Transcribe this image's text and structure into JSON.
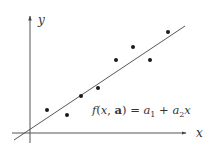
{
  "diagram": {
    "type": "linear-regression-illustration",
    "axes": {
      "x_label": "x",
      "y_label": "y",
      "origin_px": [
        30,
        133
      ],
      "x_axis_px": {
        "x1": 12,
        "x2": 186,
        "y": 133
      },
      "y_axis_px": {
        "x": 30,
        "y1": 143,
        "y2": 16
      }
    },
    "fit_line": {
      "label": "f(x, a) = a1 + a2 x",
      "from_px": [
        14,
        140
      ],
      "to_px": [
        185,
        26
      ],
      "color": "#444444"
    },
    "equation": {
      "f": "f",
      "open": "(",
      "x": "x",
      "comma": ", ",
      "a_bold": "a",
      "close": ")",
      "eq": " = ",
      "a1": "a",
      "sub1": "1",
      "plus": " + ",
      "a2": "a",
      "sub2": "2",
      "x2": "x"
    },
    "data_points_px": [
      [
        47,
        110
      ],
      [
        67,
        115
      ],
      [
        81,
        96
      ],
      [
        98,
        88
      ],
      [
        116,
        60
      ],
      [
        133,
        47
      ],
      [
        150,
        60
      ],
      [
        168,
        32
      ]
    ],
    "point_color": "#1a1a1a"
  }
}
